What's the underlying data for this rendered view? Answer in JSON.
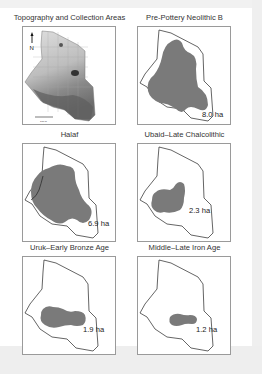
{
  "figure": {
    "panels": [
      {
        "id": "topography",
        "title": "Topography and Collection Areas",
        "area_label": null,
        "north_label": "N",
        "scale_label": "100 m"
      },
      {
        "id": "ppnb",
        "title": "Pre-Pottery Neolithic B",
        "area_label": "8.0 ha"
      },
      {
        "id": "halaf",
        "title": "Halaf",
        "area_label": "6.9 ha"
      },
      {
        "id": "ubaid",
        "title": "Ubaid–Late Chalcolithic",
        "area_label": "2.3 ha"
      },
      {
        "id": "uruk",
        "title": "Uruk–Early Bronze Age",
        "area_label": "1.9 ha"
      },
      {
        "id": "iron",
        "title": "Middle–Late Iron Age",
        "area_label": "1.2 ha"
      }
    ],
    "colors": {
      "occupation_fill": "#7a7a7a",
      "site_outline": "#222222",
      "panel_border": "#9a9a9a"
    }
  }
}
